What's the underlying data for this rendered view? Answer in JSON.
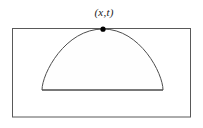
{
  "figure": {
    "title": "",
    "caption": "",
    "background_color": "#ffffff",
    "width": 203,
    "height": 128,
    "labels": {
      "apex_point": "(x,t)"
    },
    "elements": {
      "outer_rectangle_name": "domain-rectangle",
      "dome_name": "light-cone-dome",
      "point_name": "apex-point"
    },
    "colors": {
      "rectangle_stroke": "#595959",
      "dome_stroke": "#4d4d4d",
      "point_fill": "#000000",
      "interior_fill": "#fefefe"
    },
    "geometry": {
      "rectangle": {
        "x": 12.5,
        "y": 28.5,
        "width": 178,
        "height": 88.5
      },
      "dome_base_left_x": 42,
      "dome_base_right_x": 163,
      "dome_base_y": 90,
      "apex_x": 103,
      "apex_y": 29,
      "point_radius": 2.6
    }
  }
}
